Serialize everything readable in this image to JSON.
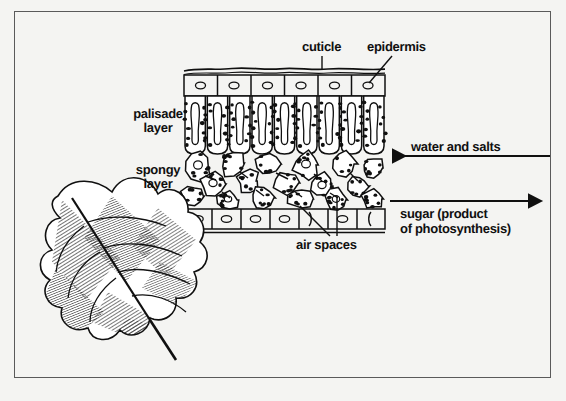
{
  "figure": {
    "background_color": "#f4f4f2",
    "ink_color": "#101010",
    "border_color": "#5a5a5a"
  },
  "labels": {
    "cuticle": "cuticle",
    "epidermis": "epidermis",
    "palisade_layer": "palisade\nlayer",
    "spongy_layer": "spongy\nlayer",
    "air_spaces": "air spaces",
    "water_and_salts": "water and salts",
    "sugar": "sugar (product\nof photosynthesis)"
  },
  "structures": [
    {
      "name": "cuticle",
      "description": "wavy outer waxy line on top of upper epidermis"
    },
    {
      "name": "upper-epidermis",
      "description": "row of 6 rectangular cells each with an oval nucleus",
      "cell_count": 6
    },
    {
      "name": "palisade-layer",
      "description": "tall columnar cells with elongated central vacuole and chloroplast dots",
      "cell_count": 9
    },
    {
      "name": "spongy-layer",
      "description": "irregular rounded cells with chloroplast dots separated by air spaces",
      "cell_count": 17
    },
    {
      "name": "lower-epidermis",
      "description": "row of rectangular cells with oval nuclei and stomatal gaps",
      "cell_count": 7
    },
    {
      "name": "whole-leaf-drawing",
      "description": "serrated hatched leaf with midrib and petiole"
    }
  ],
  "arrows": [
    {
      "name": "water-and-salts-arrow",
      "direction": "left",
      "label": "water and salts"
    },
    {
      "name": "sugar-arrow",
      "direction": "right",
      "label": "sugar (product of photosynthesis)"
    }
  ]
}
